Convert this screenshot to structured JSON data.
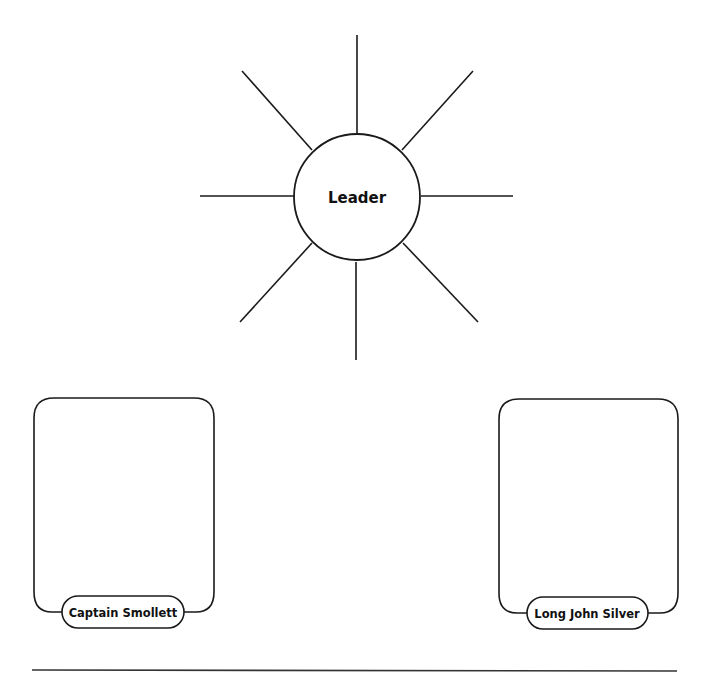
{
  "diagram": {
    "type": "graphic-organizer",
    "stroke_color": "#1a1a1a",
    "background": "#ffffff",
    "center_node": {
      "label": "Leader",
      "shape": "circle",
      "spoke_count": 8
    },
    "character_boxes": [
      {
        "label": "Captain Smollett",
        "position": "left"
      },
      {
        "label": "Long John Silver",
        "position": "right"
      }
    ],
    "footer_rule": true
  }
}
